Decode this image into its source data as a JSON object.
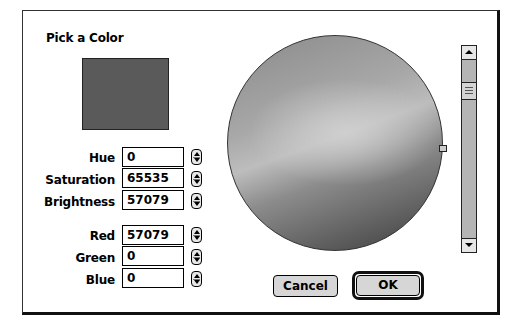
{
  "dialog": {
    "title": "Pick a Color",
    "swatch_color": "#5a5a5a"
  },
  "hsb": [
    {
      "label": "Hue",
      "value": "0"
    },
    {
      "label": "Saturation",
      "value": "65535"
    },
    {
      "label": "Brightness",
      "value": "57079"
    }
  ],
  "rgb": [
    {
      "label": "Red",
      "value": "57079"
    },
    {
      "label": "Green",
      "value": "0"
    },
    {
      "label": "Blue",
      "value": "0"
    }
  ],
  "wheel": {
    "icon": "color-wheel"
  },
  "scrollbar": {
    "up_icon": "up-arrow-icon",
    "down_icon": "down-arrow-icon"
  },
  "buttons": {
    "cancel_label": "Cancel",
    "ok_label": "OK"
  }
}
